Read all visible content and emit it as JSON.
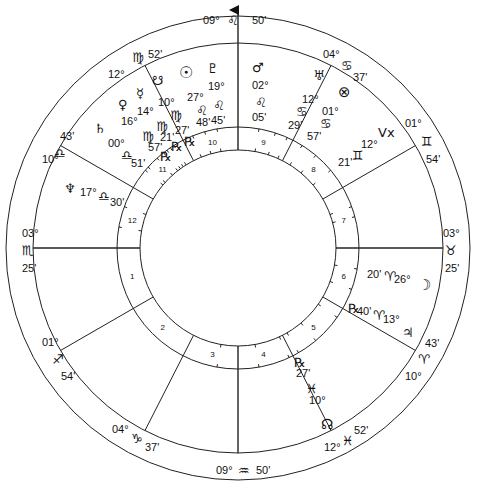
{
  "chart_title": "Natal wheel",
  "angles": {
    "mc": {
      "deg": "09°",
      "sign_glyph": "♌",
      "min": "50'"
    },
    "ic": {
      "deg": "09°",
      "sign_glyph": "♒",
      "min": "50'"
    },
    "asc": {
      "deg": "03°",
      "sign_glyph": "♏",
      "min": "25'"
    },
    "dsc": {
      "deg": "03°",
      "sign_glyph": "♉",
      "min": "25'"
    }
  },
  "house_cusps": [
    {
      "house": "11",
      "deg": "12°",
      "sign_glyph": "♍",
      "min": "52'"
    },
    {
      "house": "12",
      "deg": "10°",
      "sign_glyph": "♎",
      "min": "43'"
    },
    {
      "house": "2",
      "deg": "01°",
      "sign_glyph": "♐",
      "min": "54'"
    },
    {
      "house": "3",
      "deg": "04°",
      "sign_glyph": "♑",
      "min": "37'"
    },
    {
      "house": "5",
      "deg": "12°",
      "sign_glyph": "♓",
      "min": "52'"
    },
    {
      "house": "6",
      "deg": "10°",
      "sign_glyph": "♈",
      "min": "43'"
    },
    {
      "house": "8",
      "deg": "01°",
      "sign_glyph": "♊",
      "min": "54'"
    },
    {
      "house": "9",
      "deg": "04°",
      "sign_glyph": "♋",
      "min": "37'"
    }
  ],
  "house_numbers": [
    "1",
    "2",
    "3",
    "4",
    "5",
    "6",
    "7",
    "8",
    "9",
    "10",
    "11",
    "12"
  ],
  "planets": [
    {
      "name": "sun",
      "glyph": "☉",
      "deg": "27°",
      "sign_glyph": "♌",
      "min": "48'",
      "retro": ""
    },
    {
      "name": "pluto",
      "glyph": "♇",
      "deg": "19°",
      "sign_glyph": "♌",
      "min": "45'",
      "retro": ""
    },
    {
      "name": "mars",
      "glyph": "♂",
      "deg": "02°",
      "sign_glyph": "♌",
      "min": "05'",
      "retro": ""
    },
    {
      "name": "uranus",
      "glyph": "♅",
      "deg": "12°",
      "sign_glyph": "♋",
      "min": "29'",
      "retro": ""
    },
    {
      "name": "part-of-fortune",
      "glyph": "⊗",
      "deg": "01°",
      "sign_glyph": "♋",
      "min": "57'",
      "retro": ""
    },
    {
      "name": "vertex",
      "glyph": "Vx",
      "deg": "12°",
      "sign_glyph": "♊",
      "min": "21'",
      "retro": ""
    },
    {
      "name": "south-node",
      "glyph": "☋",
      "deg": "10°",
      "sign_glyph": "♍",
      "min": "27'",
      "retro": "℞"
    },
    {
      "name": "mercury",
      "glyph": "☿",
      "deg": "14°",
      "sign_glyph": "♍",
      "min": "21'",
      "retro": "℞"
    },
    {
      "name": "venus",
      "glyph": "♀",
      "deg": "16°",
      "sign_glyph": "♍",
      "min": "57'",
      "retro": "℞"
    },
    {
      "name": "saturn",
      "glyph": "♄",
      "deg": "00°",
      "sign_glyph": "♎",
      "min": "51'",
      "retro": ""
    },
    {
      "name": "neptune",
      "glyph": "♆",
      "deg": "17°",
      "sign_glyph": "♎",
      "min": "30'",
      "retro": ""
    },
    {
      "name": "moon",
      "glyph": "☽",
      "deg": "26°",
      "sign_glyph": "♈",
      "min": "20'",
      "retro": ""
    },
    {
      "name": "jupiter",
      "glyph": "♃",
      "deg": "13°",
      "sign_glyph": "♈",
      "min": "40'",
      "retro": "℞"
    },
    {
      "name": "north-node",
      "glyph": "☊",
      "deg": "10°",
      "sign_glyph": "♓",
      "min": "27'",
      "retro": "℞"
    }
  ]
}
